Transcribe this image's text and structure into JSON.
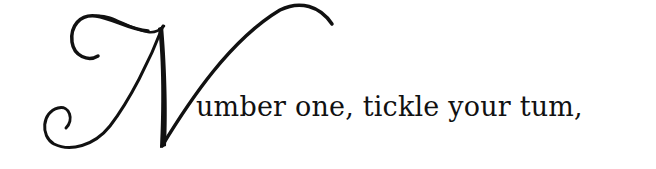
{
  "verse": {
    "drop_cap": "N",
    "line_text": "umber one, tickle your tum,"
  },
  "colors": {
    "ink": "#111111",
    "background": "#ffffff"
  }
}
